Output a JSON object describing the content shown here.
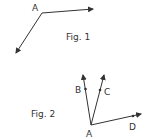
{
  "figures": [
    {
      "caption": "Fig. 1",
      "vertex_label": "A",
      "rays": [
        {
          "name": "ray-right"
        },
        {
          "name": "ray-down-left"
        }
      ]
    },
    {
      "caption": "Fig. 2",
      "vertex_label": "A",
      "rays": [
        {
          "label": "B"
        },
        {
          "label": "C"
        },
        {
          "label": "D"
        }
      ]
    }
  ],
  "colors": {
    "stroke": "#333333",
    "background": "#ffffff"
  }
}
